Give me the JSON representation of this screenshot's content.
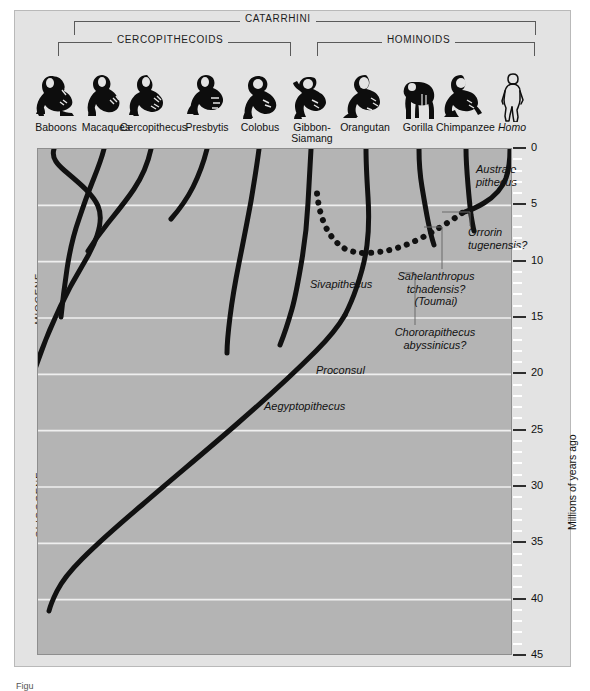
{
  "figure": {
    "caption_fragment": "Figu"
  },
  "brackets": [
    {
      "label": "CATARRHINI",
      "left": 74,
      "width": 462,
      "top": 21,
      "label_x": 240,
      "label_y": 13
    },
    {
      "label": "CERCOPITHECOIDS",
      "left": 58,
      "width": 233,
      "top": 42,
      "label_x": 112,
      "label_y": 34
    },
    {
      "label": "HOMINOIDS",
      "left": 317,
      "width": 218,
      "top": 42,
      "label_x": 382,
      "label_y": 34
    }
  ],
  "taxa": [
    {
      "name": "Baboons",
      "glyph": "monkey-silhouette",
      "italic": false,
      "x": 27,
      "tip_x": 53
    },
    {
      "name": "Macaques",
      "glyph": "monkey-silhouette",
      "italic": false,
      "x": 77,
      "tip_x": 103
    },
    {
      "name": "Cercopithecus",
      "glyph": "monkey-silhouette",
      "italic": false,
      "x": 123,
      "tip_x": 150
    },
    {
      "name": "Presbytis",
      "glyph": "monkey-silhouette",
      "italic": false,
      "x": 180,
      "tip_x": 206
    },
    {
      "name": "Colobus",
      "glyph": "monkey-silhouette",
      "italic": false,
      "x": 232,
      "tip_x": 258
    },
    {
      "name": "Gibbon-\nSiamang",
      "glyph": "gibbon-silhouette",
      "italic": false,
      "x": 283,
      "tip_x": 310
    },
    {
      "name": "Orangutan",
      "glyph": "orangutan-silhouette",
      "italic": false,
      "x": 336,
      "tip_x": 363
    },
    {
      "name": "Gorilla",
      "glyph": "gorilla-silhouette",
      "italic": false,
      "x": 390,
      "tip_x": 417
    },
    {
      "name": "Chimpanzee",
      "glyph": "chimpanzee-silhouette",
      "italic": false,
      "x": 437,
      "tip_x": 464
    },
    {
      "name": "Homo",
      "glyph": "human-silhouette",
      "italic": true,
      "x": 487,
      "tip_x": 508
    }
  ],
  "epochs": [
    {
      "label": "MIOCENE",
      "center_y": 298
    },
    {
      "label": "OLIGOCENE",
      "center_y": 504
    }
  ],
  "axis": {
    "title": "Millions of years ago",
    "title_x": 566,
    "title_y": 530,
    "unit": "Ma",
    "min": 0,
    "max": 45,
    "major_step": 5,
    "minor_step": 1,
    "labels": [
      "0",
      "5",
      "10",
      "15",
      "20",
      "25",
      "30",
      "35",
      "40",
      "45"
    ]
  },
  "fossil_labels": [
    {
      "id": "australopithecus",
      "text": "Australo-\npithecus",
      "x": 478,
      "y": 166,
      "align": "left",
      "leader": null
    },
    {
      "id": "orrorin",
      "text": "Orrorin\ntugenensis?",
      "x": 469,
      "y": 228,
      "align": "left",
      "leader": {
        "x1": 469,
        "y1": 225,
        "x2": 469,
        "y2": 211,
        "x3": 441,
        "y3": 211
      }
    },
    {
      "id": "sahelanthropus",
      "text": "Sahelanthropus\ntchadensis?\n(Toumai)",
      "x": 378,
      "y": 272,
      "align": "left",
      "leader": {
        "x1": 441,
        "y1": 268,
        "x2": 441,
        "y2": 226,
        "x3": 423,
        "y3": 226
      }
    },
    {
      "id": "chororapithecus",
      "text": "Chororapithecus\nabyssinicus?",
      "x": 375,
      "y": 328,
      "align": "left",
      "leader": {
        "x1": 414,
        "y1": 324,
        "x2": 414,
        "y2": 272,
        "x3": 400,
        "y3": 272
      }
    },
    {
      "id": "sivapithecus",
      "text": "Sivapithecus",
      "x": 312,
      "y": 280,
      "align": "left",
      "leader": null
    },
    {
      "id": "proconsul",
      "text": "Proconsul",
      "x": 318,
      "y": 366,
      "align": "left",
      "leader": null
    },
    {
      "id": "aegyptopithecus",
      "text": "Aegyptopithecus",
      "x": 266,
      "y": 402,
      "align": "left",
      "leader": null
    }
  ],
  "chart_data": {
    "type": "line",
    "xlabel": "",
    "ylabel": "Millions of years ago",
    "ylim": [
      0,
      45
    ],
    "y_inverted": true,
    "grid": "horizontal-major-5Ma",
    "plot_px": {
      "left": 37,
      "top": 148,
      "width": 475,
      "height": 507
    },
    "lineages": [
      {
        "name": "Baboons",
        "style": "solid",
        "tip_age": 0,
        "root_age": 41,
        "path": "M 16,0 C 13,9 20,16 27,22 C 40,33 55,45 60,57 C 66,71 60,90 47,112 C 30,140 12,175 -3,220 C -14,254 -22,300 -24,340 C -26,380 -22,420 -18,460"
      },
      {
        "name": "Macaques",
        "style": "solid",
        "tip_age": 0,
        "root_age": 13,
        "path": "M 66,0 C 63,12 58,24 54,34 C 50,44 45,58 41,70 C 36,84 32,100 29,120 C 26,140 24,158 23,168"
      },
      {
        "name": "Cercopithecus",
        "style": "solid",
        "tip_age": 0,
        "root_age": 9,
        "path": "M 113,0 C 110,14 104,28 96,40 C 88,52 78,64 70,74 C 62,84 55,94 50,102"
      },
      {
        "name": "Presbytis",
        "style": "solid",
        "tip_age": 0,
        "root_age": 6,
        "path": "M 169,0 C 166,12 161,26 155,38 C 148,52 140,62 133,70"
      },
      {
        "name": "Colobus",
        "style": "solid",
        "tip_age": 0,
        "root_age": 16,
        "path": "M 221,0 C 219,16 216,34 213,52 C 209,74 205,94 201,114 C 197,134 194,152 192,168 C 190,184 189,196 189,204"
      },
      {
        "name": "Gibbon-Siamang",
        "style": "solid",
        "tip_age": 0,
        "root_age": 20,
        "path": "M 273,0 C 272,18 271,36 270,54 C 269,74 267,92 264,110 C 261,128 258,146 254,160 C 250,174 246,186 242,196"
      },
      {
        "name": "Orangutan",
        "style": "solid",
        "tip_age": 0,
        "root_age": 13,
        "path": "M 328,0 C 328,16 329,32 330,48 C 331,64 331,80 329,96 C 327,112 323,126 318,140 C 314,152 310,160 307,166"
      },
      {
        "name": "Gorilla",
        "style": "solid",
        "tip_age": 0,
        "root_age": 8,
        "path": "M 381,0 C 381,14 382,26 384,38 C 386,50 388,62 390,72 C 392,82 394,90 396,96"
      },
      {
        "name": "Chimpanzee",
        "style": "solid",
        "tip_age": 0,
        "root_age": 7,
        "path": "M 428,0 C 428,12 429,24 430,36 C 431,48 432,58 433,66 C 434,72 435,78 436,82"
      },
      {
        "name": "Homo",
        "style": "solid",
        "tip_age": 0,
        "root_age": 5,
        "path": "M 472,0 C 472,10 471,20 468,29 C 464,40 456,48 446,54 C 438,59 430,62 424,64"
      },
      {
        "name": "Proconsul-trunk",
        "style": "solid",
        "tip_age": 13,
        "root_age": 41,
        "path": "M 307,166 C 300,178 290,190 278,202 C 258,222 230,248 200,274 C 168,302 134,330 104,356 C 78,378 58,396 44,410 C 32,422 24,432 19,442 C 14,452 12,458 11,462"
      },
      {
        "name": "Hominin-stem",
        "style": "dotted",
        "tip_age": 5,
        "root_age": 14,
        "path": "M 424,64 C 416,70 406,76 396,82 C 386,88 374,94 362,98 C 350,102 338,104 328,104 C 318,104 310,102 304,98 C 296,92 290,84 286,74 C 282,64 280,54 279,44"
      }
    ],
    "gridlines_ma": [
      5,
      10,
      15,
      20,
      25,
      30,
      35,
      40
    ]
  }
}
